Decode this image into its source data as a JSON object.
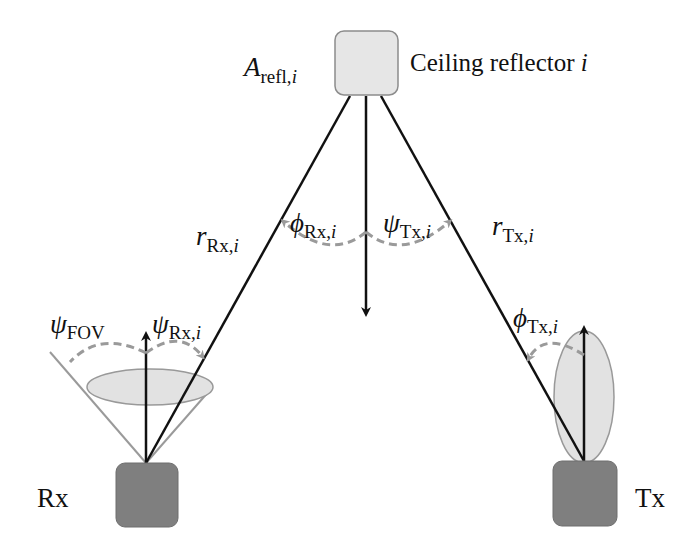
{
  "colors": {
    "background": "#ffffff",
    "line": "#111111",
    "reflector_fill": "#e6e6e6",
    "reflector_stroke": "#8c8c8c",
    "device_fill": "#7f7f7f",
    "device_stroke": "#6e6e6e",
    "beam_fill": "#e2e2e2",
    "beam_stroke": "#999999",
    "fov_line": "#9a9a9a",
    "angle_arc": "#9a9a9a"
  },
  "nodes": {
    "reflector": {
      "label": "Ceiling reflector",
      "index": "i",
      "area_symbol": "A",
      "area_subscript": "refl,",
      "area_index": "i"
    },
    "rx": {
      "label": "Rx"
    },
    "tx": {
      "label": "Tx"
    }
  },
  "edges": [
    {
      "name": "r-rx",
      "symbol": "r",
      "subscript": "Rx,",
      "index": "i"
    },
    {
      "name": "r-tx",
      "symbol": "r",
      "subscript": "Tx,",
      "index": "i"
    }
  ],
  "angles": {
    "phi_rx": {
      "symbol": "ϕ",
      "subscript": "Rx,",
      "index": "i"
    },
    "psi_tx": {
      "symbol": "ψ",
      "subscript": "Tx,",
      "index": "i"
    },
    "psi_fov": {
      "symbol": "ψ",
      "subscript": "FOV"
    },
    "psi_rx": {
      "symbol": "ψ",
      "subscript": "Rx,",
      "index": "i"
    },
    "phi_tx": {
      "symbol": "ϕ",
      "subscript": "Tx,",
      "index": "i"
    }
  }
}
